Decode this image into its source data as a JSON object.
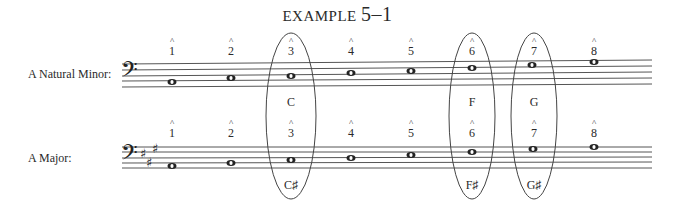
{
  "title": {
    "label": "EXAMPLE",
    "number": "5–1"
  },
  "rows": [
    {
      "label": "A  Natural Minor:",
      "degrees": [
        "1",
        "2",
        "3",
        "4",
        "5",
        "6",
        "7",
        "8"
      ],
      "highlighted_notes": {
        "3": "C",
        "6": "F",
        "7": "G"
      }
    },
    {
      "label": "A Major:",
      "degrees": [
        "1",
        "2",
        "3",
        "4",
        "5",
        "6",
        "7",
        "8"
      ],
      "highlighted_notes": {
        "3": "C♯",
        "6": "F♯",
        "7": "G♯"
      }
    }
  ],
  "labels": {
    "minor_row": "A  Natural Minor:",
    "major_row": "A Major:",
    "minor_c": "C",
    "minor_f": "F",
    "minor_g": "G",
    "major_c": "C♯",
    "major_f": "F♯",
    "major_g": "G♯",
    "d1": "1",
    "d2": "2",
    "d3": "3",
    "d4": "4",
    "d5": "5",
    "d6": "6",
    "d7": "7",
    "d8": "8",
    "hat": "^"
  },
  "clef": "bass",
  "key_signatures": {
    "minor": "none",
    "major": "3 sharps (F♯, C♯, G♯)"
  }
}
